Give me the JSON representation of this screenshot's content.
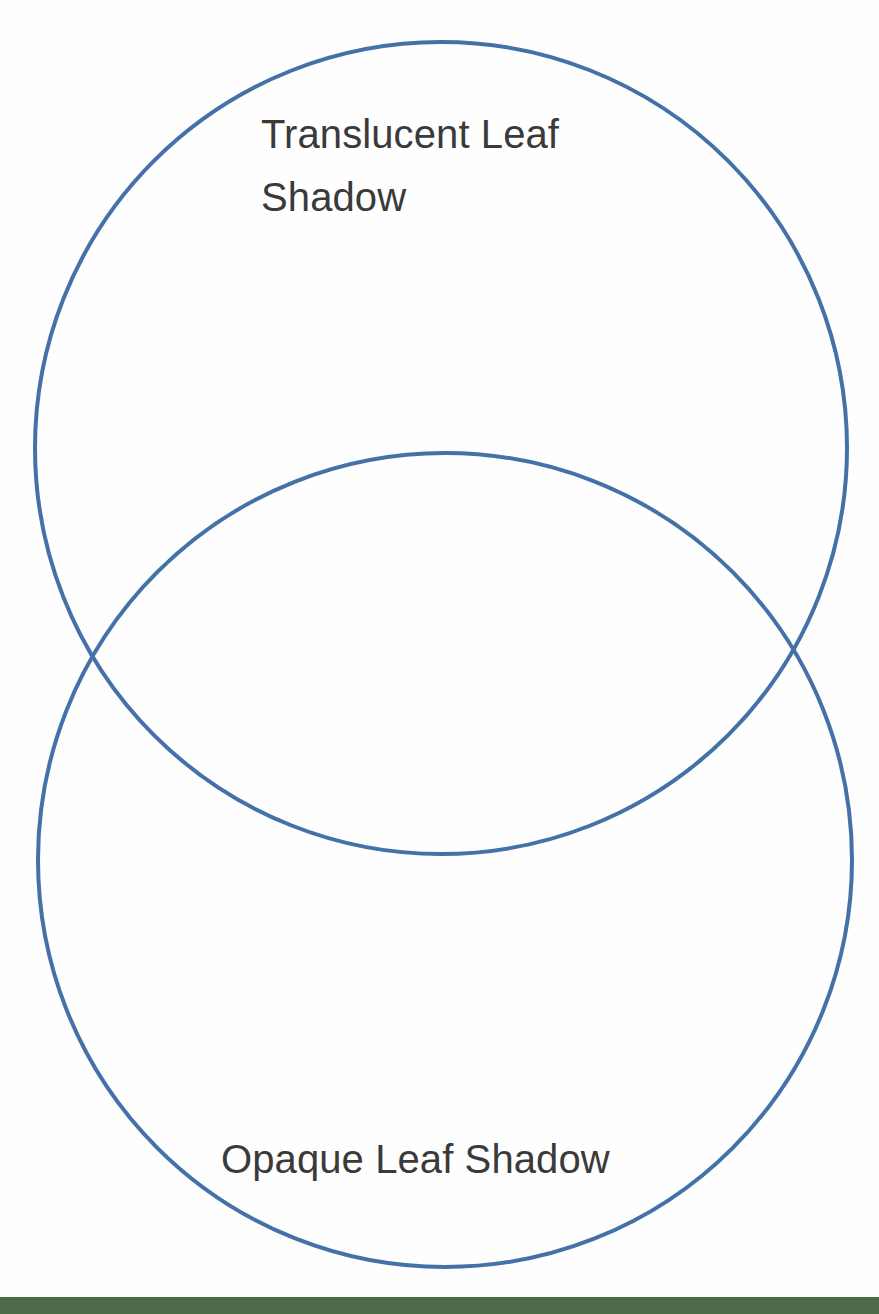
{
  "page": {
    "background_color": "#fefefe",
    "width": 879,
    "height": 1314
  },
  "diagram": {
    "type": "venn",
    "set_count": 2,
    "orientation": "vertical",
    "stroke_color": "#4472a8",
    "stroke_width": 4,
    "fill": "none",
    "circles": [
      {
        "name": "translucent-leaf-shadow-circle",
        "cx": 441,
        "cy": 448,
        "r": 406
      },
      {
        "name": "opaque-leaf-shadow-circle",
        "cx": 445,
        "cy": 860,
        "r": 407
      }
    ],
    "intersection_points": [
      {
        "x": 105,
        "y": 654
      },
      {
        "x": 785,
        "y": 653
      }
    ]
  },
  "labels": {
    "top": {
      "text": "Translucent Leaf\nShadow",
      "color": "#3a3a3a",
      "font_size": 40
    },
    "bottom": {
      "text": "Opaque Leaf Shadow",
      "color": "#3a3a3a",
      "font_size": 40
    }
  },
  "footer": {
    "bar_color": "#4a6b45",
    "height": 17
  }
}
